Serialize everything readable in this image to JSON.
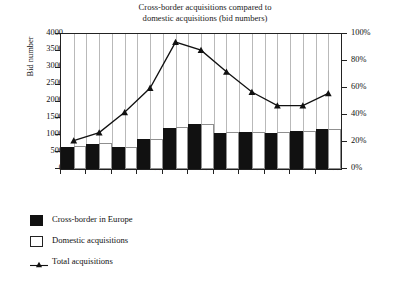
{
  "chart_data": {
    "type": "bar",
    "title": "Cross-border acquisitions compared to domestic acquisitions (bid numbers)",
    "title_line1": "Cross-border acquisitions compared to",
    "title_line2": "domestic acquisitions (bid numbers)",
    "xlabel": "",
    "ylabel": "Bid number",
    "ylabel_right": "Percentage–bid numbers",
    "ylim": [
      0,
      4000
    ],
    "ylim_right": [
      0,
      100
    ],
    "grid": true,
    "legend_position": "below-left",
    "categories": [
      "1985",
      "1986",
      "1987",
      "1988",
      "1989",
      "1990",
      "1991",
      "1992",
      "1993",
      "1994",
      "1995"
    ],
    "yticks": [
      "0",
      "500",
      "1000",
      "1500",
      "2000",
      "2500",
      "3000",
      "3500",
      "4000"
    ],
    "yticks_right": [
      "0%",
      "20%",
      "40%",
      "60%",
      "80%",
      "100%"
    ],
    "series": [
      {
        "name": "Cross-border in Europe",
        "type": "bar",
        "axis": "left",
        "color": "#111111",
        "values": [
          650,
          750,
          640,
          880,
          1230,
          1330,
          1080,
          1090,
          1080,
          1120,
          1180
        ]
      },
      {
        "name": "Domestic acquisitions",
        "type": "bar",
        "axis": "left",
        "color": "#ffffff",
        "values": [
          680,
          760,
          660,
          900,
          1240,
          1340,
          1090,
          1090,
          1090,
          1130,
          1200
        ]
      },
      {
        "name": "Total acquisitions",
        "type": "line",
        "axis": "right",
        "color": "#111111",
        "marker": "triangle",
        "values": [
          21,
          27,
          42,
          60,
          94,
          88,
          72,
          57,
          47,
          47,
          56
        ]
      }
    ]
  },
  "legend": {
    "items": [
      {
        "label": "Cross-border in Europe",
        "swatch": "black-square"
      },
      {
        "label": "Domestic acquisitions",
        "swatch": "white-square"
      },
      {
        "label": "Total acquisitions",
        "swatch": "line-triangle-marker"
      }
    ]
  }
}
